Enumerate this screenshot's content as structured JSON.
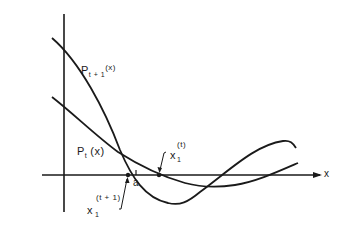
{
  "diagram": {
    "axes": {
      "x_label": "x",
      "origin": [
        64,
        175
      ]
    },
    "curves": [
      {
        "name": "P_{t+1}(x)",
        "label_main": "P",
        "label_sub": "t + 1",
        "label_arg": "(x)"
      },
      {
        "name": "P_t(x)",
        "label_main": "P",
        "label_sub": "t",
        "label_arg": "(x)"
      }
    ],
    "annotations": {
      "x1_t": {
        "main": "x",
        "sub": "1",
        "sup": "(t)"
      },
      "x1_t1": {
        "main": "x",
        "sub": "1",
        "sup": "(t + 1)"
      },
      "a_tick": "a"
    },
    "colors": {
      "line": "#1a1a1a",
      "background": "#ffffff"
    }
  }
}
